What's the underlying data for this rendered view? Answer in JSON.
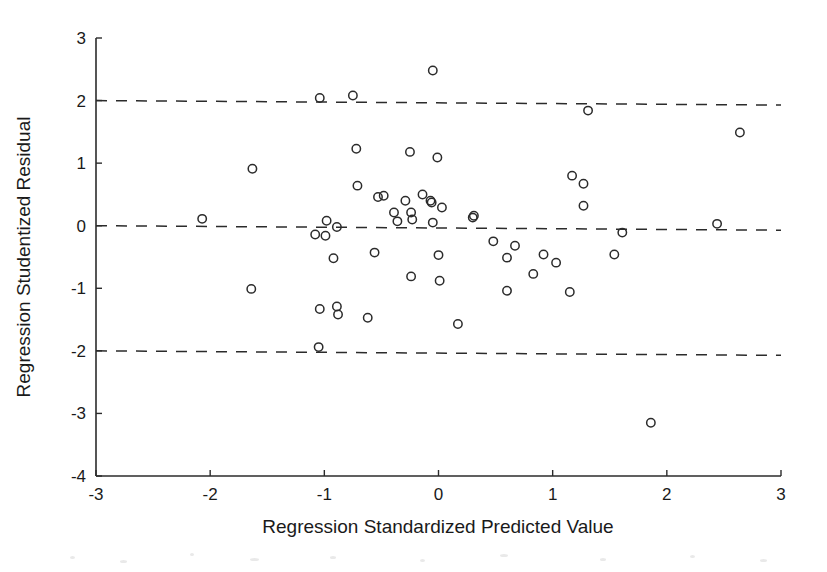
{
  "figure": {
    "background_color": "#ffffff",
    "ink_color": "#2b2b2b",
    "width": 827,
    "height": 572
  },
  "chart_data": {
    "type": "scatter",
    "title": "",
    "xlabel": "Regression Standardized Predicted Value",
    "ylabel": "Regression Studentized Residual",
    "xlim": [
      -3,
      3
    ],
    "ylim": [
      -4,
      3
    ],
    "xticks": [
      -3,
      -2,
      -1,
      0,
      1,
      2,
      3
    ],
    "xtick_labels": [
      "-3",
      "-2",
      "-1",
      "0",
      "1",
      "2",
      "3"
    ],
    "yticks": [
      -4,
      -3,
      -2,
      -1,
      0,
      1,
      2,
      3
    ],
    "ytick_labels": [
      "-4",
      "-3",
      "-2",
      "-1",
      "0",
      "1",
      "2",
      "3"
    ],
    "grid": false,
    "legend": null,
    "marker": {
      "shape": "open-circle",
      "radius": 4.2,
      "fill": "none",
      "stroke": "#2b2b2b",
      "stroke_width": 1.5
    },
    "reference_lines": [
      {
        "name": "upper-limit-line",
        "y": 2,
        "style": "dashed"
      },
      {
        "name": "zero-line",
        "y": 0,
        "style": "dashed"
      },
      {
        "name": "lower-limit-line",
        "y": -2,
        "style": "dashed"
      }
    ],
    "n_points": 64,
    "points": [
      [
        -0.05,
        2.48
      ],
      [
        -1.04,
        2.04
      ],
      [
        -0.75,
        2.08
      ],
      [
        1.31,
        1.84
      ],
      [
        2.64,
        1.49
      ],
      [
        -0.72,
        1.23
      ],
      [
        -0.25,
        1.18
      ],
      [
        -0.01,
        1.09
      ],
      [
        -1.63,
        0.91
      ],
      [
        1.17,
        0.8
      ],
      [
        1.27,
        0.67
      ],
      [
        -0.71,
        0.64
      ],
      [
        -0.48,
        0.48
      ],
      [
        -0.53,
        0.46
      ],
      [
        -0.14,
        0.5
      ],
      [
        -0.29,
        0.4
      ],
      [
        -0.07,
        0.4
      ],
      [
        -0.06,
        0.37
      ],
      [
        0.03,
        0.29
      ],
      [
        1.27,
        0.32
      ],
      [
        -0.39,
        0.21
      ],
      [
        -0.24,
        0.21
      ],
      [
        -0.23,
        0.1
      ],
      [
        -0.36,
        0.07
      ],
      [
        -0.05,
        0.05
      ],
      [
        -2.07,
        0.11
      ],
      [
        -0.98,
        0.08
      ],
      [
        0.31,
        0.16
      ],
      [
        0.3,
        0.13
      ],
      [
        2.44,
        0.03
      ],
      [
        -0.89,
        -0.02
      ],
      [
        -1.08,
        -0.14
      ],
      [
        -0.99,
        -0.16
      ],
      [
        1.61,
        -0.11
      ],
      [
        0.48,
        -0.25
      ],
      [
        0.67,
        -0.32
      ],
      [
        -0.56,
        -0.43
      ],
      [
        0.0,
        -0.47
      ],
      [
        -0.92,
        -0.52
      ],
      [
        0.6,
        -0.51
      ],
      [
        0.92,
        -0.46
      ],
      [
        1.54,
        -0.46
      ],
      [
        1.03,
        -0.59
      ],
      [
        0.83,
        -0.77
      ],
      [
        -0.24,
        -0.81
      ],
      [
        0.01,
        -0.88
      ],
      [
        -1.64,
        -1.01
      ],
      [
        0.6,
        -1.04
      ],
      [
        1.15,
        -1.06
      ],
      [
        -1.04,
        -1.33
      ],
      [
        -0.89,
        -1.29
      ],
      [
        -0.88,
        -1.42
      ],
      [
        -0.62,
        -1.47
      ],
      [
        0.17,
        -1.57
      ],
      [
        -1.05,
        -1.94
      ],
      [
        1.86,
        -3.15
      ]
    ]
  }
}
